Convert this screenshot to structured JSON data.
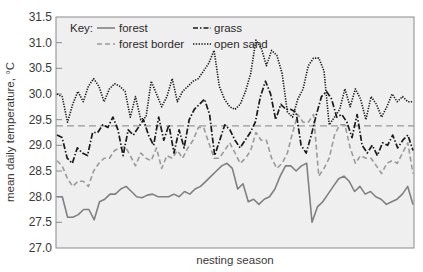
{
  "chart_data": {
    "type": "line",
    "title": "",
    "xlabel": "nesting season",
    "ylabel": "mean daily temperature, °C",
    "ylim": [
      27.0,
      31.5
    ],
    "yticks": [
      27.0,
      27.5,
      28.0,
      28.5,
      29.0,
      29.5,
      30.0,
      30.5,
      31.0,
      31.5
    ],
    "ytick_labels": [
      "27.0",
      "27.5",
      "28.0",
      "28.5",
      "29.0",
      "29.5",
      "30.0",
      "30.5",
      "31.0",
      "31.5"
    ],
    "grid": false,
    "legend": {
      "title": "Key:",
      "position": "top-left, inside plot, two columns"
    },
    "reference_line": {
      "value": 29.38,
      "style": "long-dash",
      "color": "#999999"
    },
    "series": [
      {
        "name": "forest",
        "style": "solid",
        "color": "#808080",
        "values": [
          28.0,
          28.0,
          27.6,
          27.6,
          27.65,
          27.75,
          27.75,
          27.55,
          27.9,
          27.95,
          28.05,
          28.05,
          28.15,
          28.2,
          28.1,
          28.0,
          27.98,
          28.03,
          28.05,
          28.0,
          28.0,
          28.0,
          28.05,
          28.0,
          28.1,
          28.05,
          28.15,
          28.2,
          28.3,
          28.4,
          28.5,
          28.6,
          28.65,
          28.55,
          28.15,
          28.25,
          27.9,
          27.95,
          27.85,
          27.95,
          28.0,
          28.15,
          28.4,
          28.6,
          28.6,
          28.5,
          28.6,
          28.65,
          27.5,
          27.8,
          27.9,
          28.05,
          28.2,
          28.35,
          28.4,
          28.3,
          28.1,
          28.2,
          28.05,
          28.1,
          28.0,
          27.95,
          27.85,
          27.9,
          27.95,
          28.05,
          28.2,
          27.85
        ]
      },
      {
        "name": "forest border",
        "style": "dashed",
        "color": "#9a9a9a",
        "values": [
          28.7,
          28.6,
          28.35,
          28.2,
          28.3,
          28.3,
          28.2,
          28.5,
          28.65,
          28.75,
          28.75,
          28.9,
          28.95,
          28.98,
          28.8,
          28.6,
          28.85,
          28.75,
          28.7,
          28.95,
          28.55,
          28.8,
          28.75,
          28.9,
          28.75,
          28.95,
          29.1,
          29.35,
          29.35,
          29.05,
          28.75,
          28.75,
          28.9,
          29.05,
          28.85,
          28.65,
          28.75,
          28.9,
          29.25,
          29.1,
          29.1,
          28.75,
          28.55,
          28.65,
          28.85,
          29.25,
          29.6,
          29.45,
          29.45,
          29.6,
          28.4,
          28.55,
          28.75,
          29.2,
          29.4,
          29.4,
          28.95,
          28.65,
          28.8,
          28.75,
          28.75,
          28.6,
          28.45,
          28.65,
          28.7,
          28.65,
          28.85,
          29.05,
          28.45
        ]
      },
      {
        "name": "grass",
        "style": "dash-dot",
        "color": "#1a1a1a",
        "values": [
          29.2,
          29.15,
          28.75,
          28.65,
          28.95,
          28.85,
          28.8,
          29.25,
          29.25,
          29.4,
          29.35,
          29.55,
          29.3,
          28.8,
          29.3,
          29.2,
          29.35,
          29.5,
          29.2,
          29.0,
          29.55,
          29.1,
          29.4,
          28.85,
          29.3,
          28.95,
          29.5,
          29.7,
          29.8,
          29.9,
          29.6,
          28.8,
          29.1,
          29.4,
          29.3,
          29.1,
          28.95,
          29.1,
          29.25,
          29.45,
          29.95,
          30.25,
          30.0,
          29.5,
          29.8,
          29.7,
          29.7,
          29.65,
          29.0,
          28.85,
          29.2,
          29.6,
          29.95,
          30.05,
          29.9,
          29.55,
          29.6,
          29.45,
          29.15,
          29.6,
          29.0,
          28.85,
          29.0,
          28.8,
          29.05,
          29.0,
          29.2,
          28.95,
          29.1,
          29.2,
          28.9
        ]
      },
      {
        "name": "open sand",
        "style": "dotted",
        "color": "#1a1a1a",
        "values": [
          30.0,
          29.95,
          29.45,
          29.8,
          30.05,
          29.85,
          30.15,
          30.3,
          30.15,
          29.85,
          30.1,
          30.2,
          30.15,
          30.05,
          29.55,
          29.95,
          29.5,
          29.55,
          30.25,
          30.0,
          29.75,
          29.95,
          30.3,
          29.85,
          30.05,
          30.15,
          30.25,
          30.3,
          30.45,
          30.6,
          30.85,
          30.15,
          29.9,
          29.75,
          29.7,
          29.8,
          30.05,
          30.4,
          31.05,
          30.9,
          30.55,
          30.85,
          30.75,
          30.4,
          29.65,
          29.55,
          29.9,
          30.1,
          30.55,
          30.7,
          30.7,
          30.45,
          29.4,
          29.55,
          29.7,
          30.1,
          29.75,
          30.1,
          29.9,
          29.5,
          29.95,
          29.8,
          29.55,
          29.75,
          30.0,
          29.85,
          29.95,
          29.85,
          29.85
        ]
      }
    ]
  },
  "axes": {
    "xlabel": "nesting season",
    "ylabel": "mean daily temperature, °C"
  },
  "legend": {
    "title": "Key:",
    "items": [
      "forest",
      "forest border",
      "grass",
      "open sand"
    ]
  }
}
